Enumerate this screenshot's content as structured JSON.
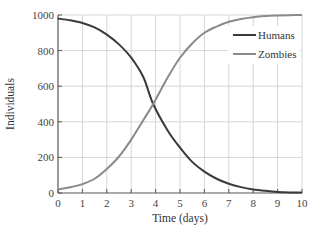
{
  "chart_data": {
    "type": "line",
    "title": "",
    "xlabel": "Time (days)",
    "ylabel": "Individuals",
    "xlim": [
      0,
      10
    ],
    "ylim": [
      0,
      1000
    ],
    "xticks": [
      0,
      1,
      2,
      3,
      4,
      5,
      6,
      7,
      8,
      9,
      10
    ],
    "yticks": [
      0,
      200,
      400,
      600,
      800,
      1000
    ],
    "grid": true,
    "legend_position": "upper right",
    "x": [
      0,
      0.5,
      1,
      1.5,
      2,
      2.5,
      3,
      3.5,
      3.9,
      4.5,
      5,
      5.5,
      6,
      6.5,
      7,
      7.5,
      8,
      8.5,
      9,
      9.5,
      10
    ],
    "series": [
      {
        "name": "Humans",
        "color": "#3a3a3a",
        "values": [
          980,
          970,
          955,
          930,
          890,
          835,
          760,
          650,
          500,
          350,
          255,
          175,
          120,
          80,
          52,
          33,
          20,
          12,
          6,
          3,
          2
        ]
      },
      {
        "name": "Zombies",
        "color": "#8a8a8a",
        "values": [
          20,
          32,
          50,
          80,
          135,
          205,
          300,
          410,
          500,
          650,
          760,
          840,
          900,
          935,
          962,
          978,
          988,
          994,
          997,
          999,
          1000
        ]
      }
    ]
  },
  "legend": {
    "items": [
      {
        "label": "Humans",
        "color": "#3a3a3a"
      },
      {
        "label": "Zombies",
        "color": "#8a8a8a"
      }
    ]
  },
  "axes": {
    "x_title": "Time (days)",
    "y_title": "Individuals",
    "x_tick_labels": [
      "0",
      "1",
      "2",
      "3",
      "4",
      "5",
      "6",
      "7",
      "8",
      "9",
      "10"
    ],
    "y_tick_labels": [
      "0",
      "200",
      "400",
      "600",
      "800",
      "1000"
    ]
  },
  "style": {
    "grid_color": "#d6d6d6",
    "axis_color": "#555555"
  }
}
